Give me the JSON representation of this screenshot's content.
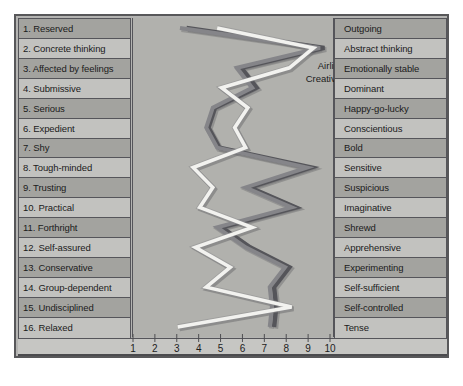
{
  "figure": {
    "background_color": "#b4b4b2",
    "frame_color": "#58585a"
  },
  "legend": {
    "items": [
      {
        "label": "Airline pilots",
        "color": "#f2f2ef"
      },
      {
        "label": "Creative artists",
        "color": "#55555a"
      },
      {
        "label": "Writers",
        "color": "#858589"
      }
    ]
  },
  "axis": {
    "ticks": [
      "1",
      "2",
      "3",
      "4",
      "5",
      "6",
      "7",
      "8",
      "9",
      "10"
    ],
    "min": 1,
    "max": 10
  },
  "left_labels": [
    "1. Reserved",
    "2. Concrete thinking",
    "3. Affected by feelings",
    "4. Submissive",
    "5. Serious",
    "6. Expedient",
    "7. Shy",
    "8. Tough-minded",
    "9. Trusting",
    "10. Practical",
    "11. Forthright",
    "12. Self-assured",
    "13. Conservative",
    "14. Group-dependent",
    "15. Undisciplined",
    "16. Relaxed"
  ],
  "right_labels": [
    "Outgoing",
    "Abstract thinking",
    "Emotionally stable",
    "Dominant",
    "Happy-go-lucky",
    "Conscientious",
    "Bold",
    "Sensitive",
    "Suspicious",
    "Imaginative",
    "Shrewd",
    "Apprehensive",
    "Experimenting",
    "Self-sufficient",
    "Self-controlled",
    "Tense"
  ],
  "chart_data": {
    "type": "line",
    "orientation": "horizontal",
    "xlabel": "",
    "ylabel": "",
    "xlim": [
      1,
      10
    ],
    "grid": false,
    "legend_position": "top-center",
    "categories": [
      "1. Reserved / Outgoing",
      "2. Concrete thinking / Abstract thinking",
      "3. Affected by feelings / Emotionally stable",
      "4. Submissive / Dominant",
      "5. Serious / Happy-go-lucky",
      "6. Expedient / Conscientious",
      "7. Shy / Bold",
      "8. Tough-minded / Sensitive",
      "9. Trusting / Suspicious",
      "10. Practical / Imaginative",
      "11. Forthright / Shrewd",
      "12. Self-assured / Apprehensive",
      "13. Conservative / Experimenting",
      "14. Group-dependent / Self-sufficient",
      "15. Undisciplined / Self-controlled",
      "16. Relaxed / Tense"
    ],
    "series": [
      {
        "name": "Airline pilots",
        "color": "#f2f2ef",
        "values": [
          4.8,
          9.2,
          8.1,
          5.0,
          6.2,
          5.6,
          6.1,
          3.7,
          4.6,
          4.0,
          6.4,
          3.8,
          5.4,
          4.3,
          8.2,
          3.0
        ]
      },
      {
        "name": "Creative artists",
        "color": "#55555a",
        "values": [
          3.4,
          9.7,
          5.9,
          6.6,
          4.7,
          4.4,
          4.9,
          9.1,
          6.3,
          8.4,
          5.0,
          6.3,
          8.1,
          7.4,
          7.5,
          7.4
        ]
      },
      {
        "name": "Writers",
        "color": "#858589",
        "values": [
          3.1,
          9.5,
          5.7,
          6.4,
          4.6,
          4.3,
          4.8,
          8.9,
          6.1,
          8.2,
          4.8,
          6.1,
          7.9,
          7.2,
          7.3,
          7.2
        ]
      }
    ]
  }
}
